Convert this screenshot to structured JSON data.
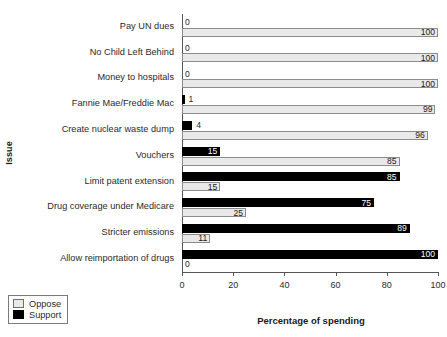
{
  "chart_data": {
    "type": "bar",
    "orientation": "horizontal",
    "title": "",
    "xlabel": "Percentage of spending",
    "ylabel": "Issue",
    "xlim": [
      0,
      100
    ],
    "xticks": [
      0,
      20,
      40,
      60,
      80,
      100
    ],
    "grid": false,
    "legend_position": "bottom-left",
    "categories": [
      "Pay UN dues",
      "No Child Left Behind",
      "Money to hospitals",
      "Fannie Mae/Freddie Mac",
      "Create nuclear waste dump",
      "Vouchers",
      "Limit patent extension",
      "Drug coverage under Medicare",
      "Stricter emissions",
      "Allow reimportation of drugs"
    ],
    "series": [
      {
        "name": "Support",
        "color": "#000000",
        "values": [
          0,
          0,
          0,
          1,
          4,
          15,
          85,
          75,
          89,
          100
        ]
      },
      {
        "name": "Oppose",
        "color": "#e9e9e9",
        "values": [
          100,
          100,
          100,
          99,
          96,
          85,
          15,
          25,
          11,
          0
        ]
      }
    ]
  },
  "legend": {
    "items": [
      {
        "label": "Oppose",
        "swatch": "oppose"
      },
      {
        "label": "Support",
        "swatch": "support"
      }
    ]
  }
}
